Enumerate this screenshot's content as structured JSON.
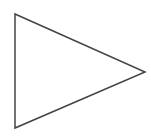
{
  "diagram": {
    "shape": "triangle",
    "orientation": "right-pointing",
    "fill": "#ffffff",
    "stroke": "#444444",
    "stroke_width": 1.5,
    "vertices": {
      "top_left": [
        15,
        14
      ],
      "bottom_left": [
        15,
        128
      ],
      "right_tip": [
        145,
        72
      ]
    },
    "points": "15,14 145,72 15,128"
  }
}
